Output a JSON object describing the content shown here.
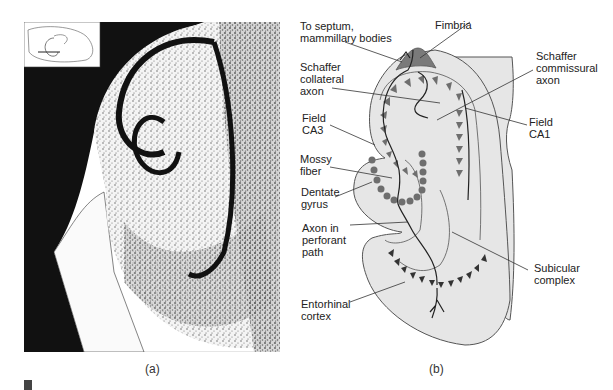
{
  "figure": {
    "panel_a": {
      "caption": "(a)",
      "type": "photomicrograph",
      "inset": "brain-orientation-inset"
    },
    "panel_b": {
      "caption": "(b)",
      "labels": {
        "to_septum": "To septum,\nmammillary bodies",
        "fimbria": "Fimbria",
        "schaffer_collateral": "Schaffer\ncollateral\naxon",
        "schaffer_commissural": "Schaffer\ncommissural\naxon",
        "field_ca3": "Field\nCA3",
        "field_ca1": "Field\nCA1",
        "mossy_fiber": "Mossy\nfiber",
        "dentate_gyrus": "Dentate\ngyrus",
        "axon_perforant": "Axon in\nperforant\npath",
        "subicular_complex": "Subicular\ncomplex",
        "entorhinal_cortex": "Entorhinal\ncortex"
      },
      "colors": {
        "tissue_fill": "#e6e6e6",
        "fimbria_fill": "#7a7a7a",
        "ca_neurons": "#6e6e6e",
        "granule_cells": "#6e6e6e",
        "entorhinal_neurons": "#333333",
        "outline": "#555555"
      }
    }
  }
}
